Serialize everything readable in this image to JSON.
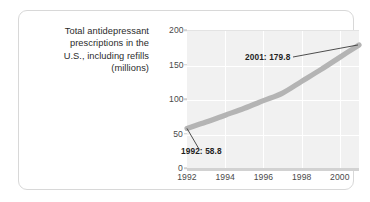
{
  "card": {
    "caption_lines": [
      "Total antidepressant",
      "prescriptions in the",
      "U.S., including refills",
      "(millions)"
    ]
  },
  "chart_data": {
    "type": "line",
    "title": "Total antidepressant prescriptions in the U.S., including refills (millions)",
    "xlabel": "",
    "ylabel": "",
    "x": [
      1992,
      1993,
      1994,
      1995,
      1996,
      1997,
      1998,
      1999,
      2000,
      2001
    ],
    "values": [
      58.8,
      68.0,
      78.0,
      88.0,
      99.0,
      110.0,
      127.0,
      144.0,
      162.0,
      179.8
    ],
    "series": [
      {
        "name": "Total antidepressant prescriptions (millions)",
        "values": [
          58.8,
          68.0,
          78.0,
          88.0,
          99.0,
          110.0,
          127.0,
          144.0,
          162.0,
          179.8
        ]
      }
    ],
    "xlim": [
      1992,
      2001
    ],
    "ylim": [
      0,
      200
    ],
    "ytick_labels": [
      "0",
      "50",
      "100",
      "150",
      "200"
    ],
    "ytick_values": [
      0,
      50,
      100,
      150,
      200
    ],
    "xtick_labels": [
      "1992",
      "1994",
      "1996",
      "1998",
      "2000"
    ],
    "xtick_values": [
      1992,
      1994,
      1996,
      1998,
      2000
    ],
    "grid": true,
    "legend": "none",
    "line_color": "#b4b4b4",
    "plot_background": "#f1f1f1",
    "gridline_color": "#ffffff",
    "annotations": [
      {
        "label": "1992: 58.8",
        "x": 1992,
        "y": 58.8
      },
      {
        "label": "2001: 179.8",
        "x": 2001,
        "y": 179.8
      }
    ]
  }
}
